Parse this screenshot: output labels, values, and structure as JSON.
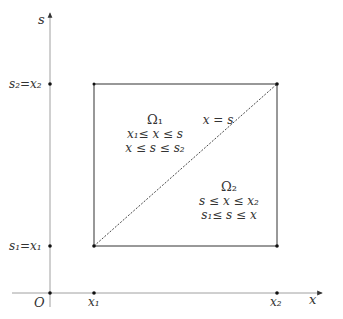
{
  "diagram": {
    "type": "integration-region",
    "axes": {
      "x_label": "x",
      "y_label": "s",
      "origin_label": "O",
      "x_ticks": [
        "x₁",
        "x₂"
      ],
      "y_ticks": [
        "s₁=x₁",
        "s₂=x₂"
      ]
    },
    "regions": [
      {
        "name": "Ω₁",
        "conditions": [
          "x₁≤ x ≤ s",
          "x ≤ s ≤ s₂"
        ]
      },
      {
        "name": "Ω₂",
        "conditions": [
          "s ≤ x ≤ x₂",
          "s₁≤ s ≤ x"
        ]
      }
    ],
    "diagonal_label": "x = s",
    "colors": {
      "lines": "#333333",
      "axes": "#666666",
      "background": "#ffffff"
    }
  }
}
